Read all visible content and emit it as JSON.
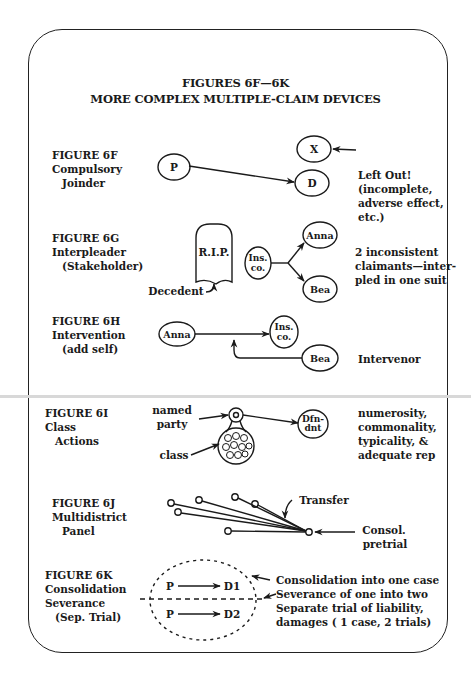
{
  "page": {
    "title_line1": "FIGURES 6F—6K",
    "title_line2": "MORE COMPLEX MULTIPLE-CLAIM DEVICES"
  },
  "figures": [
    {
      "id": "6F",
      "label": [
        "FIGURE 6F",
        "Compulsory",
        "Joinder"
      ],
      "nodes": {
        "p": "P",
        "d": "D",
        "x": "X"
      },
      "notes": [
        "Left Out!",
        "(incomplete,",
        "adverse effect,",
        "etc.)"
      ]
    },
    {
      "id": "6G",
      "label": [
        "FIGURE 6G",
        "Interpleader",
        "(Stakeholder)"
      ],
      "nodes": {
        "tomb": "R.I.P.",
        "decedent": "Decedent",
        "ins1": "Ins.",
        "ins2": "co.",
        "anna": "Anna",
        "bea": "Bea"
      },
      "notes": [
        "2 inconsistent",
        "claimants—inter-",
        "pled in one suit"
      ]
    },
    {
      "id": "6H",
      "label": [
        "FIGURE 6H",
        "Intervention",
        "(add self)"
      ],
      "nodes": {
        "anna": "Anna",
        "ins1": "Ins.",
        "ins2": "co.",
        "bea": "Bea"
      },
      "notes": [
        "Intervenor"
      ]
    },
    {
      "id": "6I",
      "label": [
        "FIGURE 6I",
        "Class",
        "Actions"
      ],
      "nodes": {
        "named": "named",
        "party": "party",
        "class": "class",
        "dfn1": "Dfn-",
        "dfn2": "dnt"
      },
      "notes": [
        "numerosity,",
        "commonality,",
        "typicality, &",
        "adequate rep"
      ]
    },
    {
      "id": "6J",
      "label": [
        "FIGURE 6J",
        "Multidistrict",
        "Panel"
      ],
      "nodes": {
        "transfer": "Transfer",
        "consol1": "Consol.",
        "consol2": "pretrial"
      },
      "notes": []
    },
    {
      "id": "6K",
      "label": [
        "FIGURE 6K",
        "Consolidation",
        "Severance",
        "(Sep. Trial)"
      ],
      "nodes": {
        "p1": "P",
        "d1": "D1",
        "p2": "P",
        "d2": "D2"
      },
      "notes": [
        "Consolidation into one case",
        "Severance of one into two",
        "Separate trial of liability,",
        "damages ( 1 case, 2 trials)"
      ]
    }
  ]
}
